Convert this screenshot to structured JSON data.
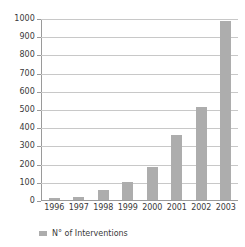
{
  "chart_data": {
    "type": "bar",
    "title": "",
    "subtitle": "",
    "xlabel": "",
    "ylabel": "",
    "categories": [
      "1996",
      "1997",
      "1998",
      "1999",
      "2000",
      "2001",
      "2002",
      "2003"
    ],
    "values": [
      12,
      15,
      55,
      100,
      185,
      360,
      515,
      990
    ],
    "series": [
      {
        "name": "N° of Interventions",
        "values": [
          12,
          15,
          55,
          100,
          185,
          360,
          515,
          990
        ]
      }
    ],
    "ylim": [
      0,
      1000
    ],
    "ytick_labels": [
      "0",
      "100",
      "200",
      "300",
      "400",
      "500",
      "600",
      "700",
      "800",
      "900",
      "1000"
    ],
    "ytick_values": [
      0,
      100,
      200,
      300,
      400,
      500,
      600,
      700,
      800,
      900,
      1000
    ],
    "grid": true,
    "grid_axis": "y",
    "legend": {
      "position": "bottom-left",
      "entries": [
        {
          "label": "N° of Interventions",
          "color": "#adadad",
          "marker": "square-swatch"
        }
      ]
    },
    "colors": {
      "bar": "#adadad",
      "gridline": "#c8c8c8",
      "axis": "#9a9a9a",
      "text": "#3a3a3a",
      "background": "#ffffff"
    }
  }
}
